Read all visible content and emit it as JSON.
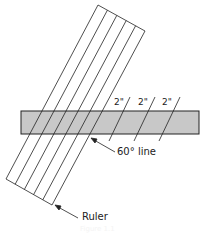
{
  "diagram": {
    "dimension_labels": [
      "2\"",
      "2\"",
      "2\""
    ],
    "callouts": {
      "line": "60° line",
      "ruler": "Ruler"
    },
    "caption": "Figure 1.1",
    "colors": {
      "bar_fill": "#c8c8c8",
      "stroke": "#222222",
      "background": "#ffffff"
    }
  }
}
